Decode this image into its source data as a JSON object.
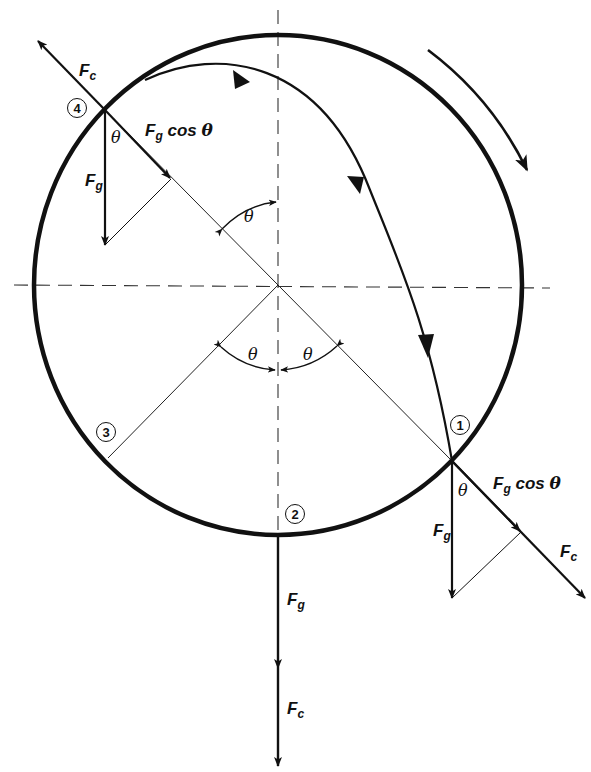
{
  "figure": {
    "type": "physics free-body diagram",
    "colors": {
      "ink": "#111111",
      "background": "#ffffff"
    }
  },
  "positions": [
    {
      "id": "1",
      "label": "1"
    },
    {
      "id": "2",
      "label": "2"
    },
    {
      "id": "3",
      "label": "3"
    },
    {
      "id": "4",
      "label": "4"
    }
  ],
  "labels": {
    "fc_symbol": "F",
    "fc_sub": "c",
    "fg_symbol": "F",
    "fg_sub": "g",
    "fg_cos_theta_rest": " cos ",
    "theta": "θ"
  },
  "annotations": {
    "rotation_direction": "clockwise",
    "angle_symbol": "θ"
  }
}
